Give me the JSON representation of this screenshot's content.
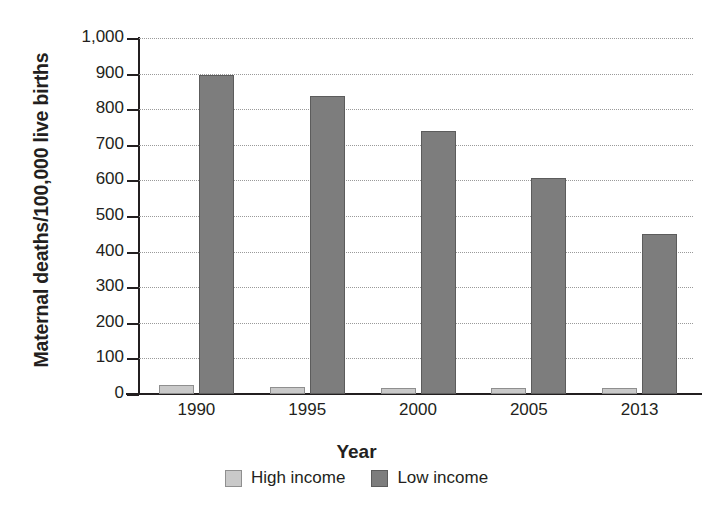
{
  "chart_data": {
    "type": "bar",
    "title": "",
    "xlabel": "Year",
    "ylabel": "Maternal deaths/100,000 live births",
    "categories": [
      "1990",
      "1995",
      "2000",
      "2005",
      "2013"
    ],
    "series": [
      {
        "name": "High income",
        "color": "#c9c9c9",
        "values": [
          25,
          20,
          17,
          16,
          16
        ]
      },
      {
        "name": "Low income",
        "color": "#7d7d7d",
        "values": [
          897,
          837,
          739,
          608,
          450
        ]
      }
    ],
    "ylim": [
      0,
      1000
    ],
    "ytick_values": [
      0,
      100,
      200,
      300,
      400,
      500,
      600,
      700,
      800,
      900,
      1000
    ],
    "ytick_labels": [
      "0",
      "100",
      "200",
      "300",
      "400",
      "500",
      "600",
      "700",
      "800",
      "900",
      "1,000"
    ],
    "grid": true,
    "legend_position": "bottom",
    "legend_entries": [
      "High income",
      "Low income"
    ]
  }
}
